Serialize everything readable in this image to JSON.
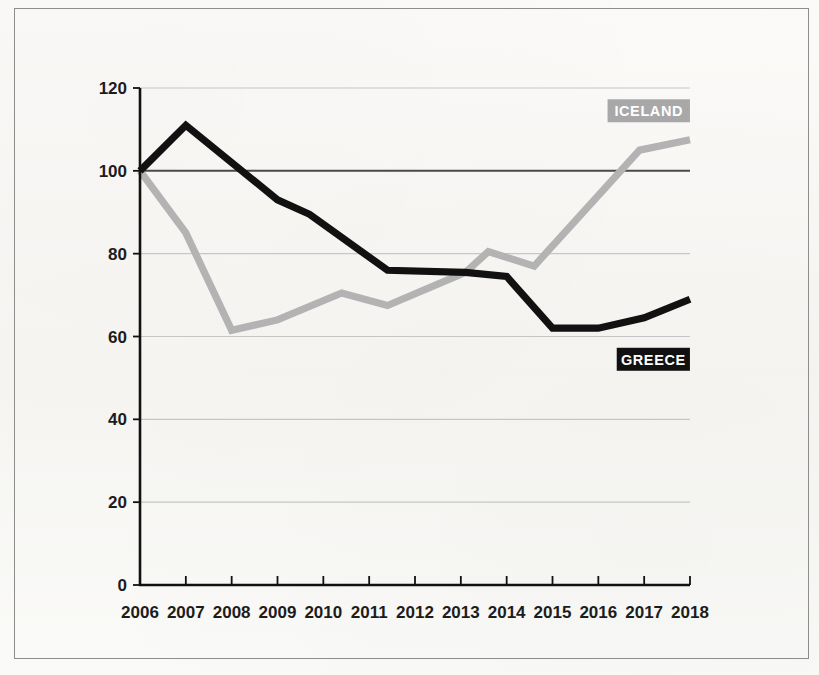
{
  "chart_data": {
    "type": "line",
    "title": "",
    "subtitle": "",
    "xlabel": "",
    "ylabel": "",
    "xlim": [
      2006,
      2018
    ],
    "ylim": [
      0,
      120
    ],
    "ytick_values": [
      0,
      20,
      40,
      60,
      80,
      100,
      120
    ],
    "ytick_labels": [
      "0",
      "20",
      "40",
      "60",
      "80",
      "100",
      "120"
    ],
    "xtick_labels": [
      "2006",
      "2007",
      "2008",
      "2009",
      "2010",
      "2011",
      "2012",
      "2013",
      "2014",
      "2015",
      "2016",
      "2017",
      "2018"
    ],
    "grid": true,
    "gridline_values": [
      20,
      40,
      60,
      80,
      100,
      120
    ],
    "baseline_value": 100,
    "legend_position": "inside-right",
    "series": [
      {
        "name": "ICELAND",
        "color": "#b3b3b3",
        "label_text_color": "#ffffff",
        "label_bg_color": "#a8a8a8",
        "x": [
          2006,
          2007,
          2008,
          2009,
          2010.4,
          2011.4,
          2013.1,
          2013.6,
          2014.6,
          2016.9,
          2018
        ],
        "values": [
          100,
          85,
          61.5,
          64,
          70.5,
          67.5,
          75.5,
          80.5,
          77,
          105,
          107.5
        ]
      },
      {
        "name": "GREECE",
        "color": "#111111",
        "label_text_color": "#ffffff",
        "label_bg_color": "#111111",
        "x": [
          2006,
          2007,
          2009,
          2009.7,
          2011.4,
          2013.1,
          2014,
          2015,
          2016,
          2017,
          2018
        ],
        "values": [
          100,
          111,
          93,
          89.5,
          76,
          75.5,
          74.5,
          62,
          62,
          64.5,
          69
        ]
      }
    ],
    "annotations": [
      {
        "text": "ICELAND",
        "x": 2017.1,
        "y": 114.5,
        "style": "gray-box"
      },
      {
        "text": "GREECE",
        "x": 2017.2,
        "y": 54.5,
        "style": "black-box"
      }
    ]
  },
  "colors": {
    "background": "#faf9f7",
    "frame_border": "#8d8d8d",
    "axis": "#111111",
    "gridline": "#c6c6c6",
    "baseline_100": "#4a4a4a",
    "greece": "#111111",
    "iceland": "#b3b3b3"
  }
}
